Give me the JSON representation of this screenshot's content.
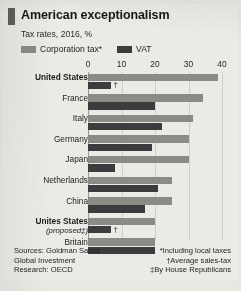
{
  "header": {
    "title": "American exceptionalism",
    "subtitle": "Tax rates, 2016, %"
  },
  "legend": {
    "items": [
      {
        "label": "Corporation tax*",
        "color": "#8c8a85",
        "name": "corporation-tax"
      },
      {
        "label": "VAT",
        "color": "#3c3c3e",
        "name": "vat"
      }
    ]
  },
  "footer": {
    "sources": [
      "Sources: Goldman Sachs",
      "Global Investment",
      "Research: OECD"
    ],
    "notes": [
      "*Including local taxes",
      "†Average sales-tax",
      "‡By House Republicans"
    ]
  },
  "annotations": {
    "us_vat_marker": "†",
    "us_proposed_vat_marker": "†"
  },
  "colors": {
    "corporation_tax": "#8c8a85",
    "vat": "#3c3c3e",
    "background": "#eceae5",
    "accent": "#5d5d5b",
    "gridline": "#cfcdc7"
  },
  "chart_data": {
    "type": "bar",
    "orientation": "horizontal",
    "title": "American exceptionalism",
    "subtitle": "Tax rates, 2016, %",
    "xlabel": "",
    "ylabel": "",
    "xlim": [
      0,
      40
    ],
    "xticks": [
      0,
      10,
      20,
      30,
      40
    ],
    "grid": true,
    "legend_position": "top-left",
    "categories": [
      "United States",
      "France",
      "Italy",
      "Germany",
      "Japan",
      "Netherlands",
      "China",
      "Unites States (proposed‡)",
      "Britain"
    ],
    "category_labels": [
      {
        "main": "United States",
        "sub": "",
        "bold": true
      },
      {
        "main": "France",
        "sub": "",
        "bold": false
      },
      {
        "main": "Italy",
        "sub": "",
        "bold": false
      },
      {
        "main": "Germany",
        "sub": "",
        "bold": false
      },
      {
        "main": "Japan",
        "sub": "",
        "bold": false
      },
      {
        "main": "Netherlands",
        "sub": "",
        "bold": false
      },
      {
        "main": "China",
        "sub": "",
        "bold": false
      },
      {
        "main": "Unites States",
        "sub": "(proposed‡)",
        "bold": true
      },
      {
        "main": "Britain",
        "sub": "",
        "bold": false
      }
    ],
    "series": [
      {
        "name": "Corporation tax*",
        "color": "#8c8a85",
        "values": [
          38.9,
          34.4,
          31.4,
          30.2,
          30.0,
          25.0,
          25.0,
          20.0,
          20.0
        ]
      },
      {
        "name": "VAT",
        "color": "#3c3c3e",
        "values": [
          7.0,
          20.0,
          22.0,
          19.0,
          8.0,
          21.0,
          17.0,
          7.0,
          20.0
        ]
      }
    ]
  }
}
